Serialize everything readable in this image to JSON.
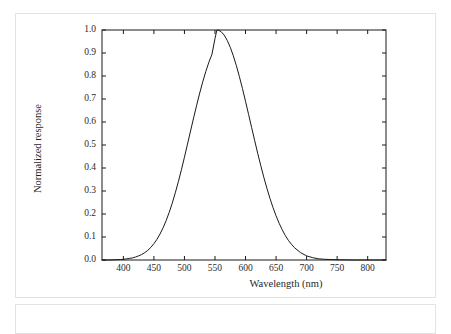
{
  "figure": {
    "chart_data": {
      "type": "line",
      "title": "",
      "subtitle": "",
      "xlabel": "Wavelength (nm)",
      "ylabel": "Normalized response",
      "xlim": [
        365,
        830
      ],
      "ylim": [
        0.0,
        1.0
      ],
      "grid": false,
      "legend": null,
      "annotations": [],
      "xticks": [
        400,
        450,
        500,
        550,
        600,
        650,
        700,
        750,
        800
      ],
      "xtick_labels": [
        "400",
        "450",
        "500",
        "550",
        "600",
        "650",
        "700",
        "750",
        "800"
      ],
      "yticks": [
        0.0,
        0.1,
        0.2,
        0.3,
        0.4,
        0.5,
        0.6,
        0.7,
        0.8,
        0.9,
        1.0
      ],
      "ytick_labels": [
        "0.0",
        "0.1",
        "0.2",
        "0.3",
        "0.4",
        "0.5",
        "0.6",
        "0.7",
        "0.8",
        "0.9",
        "1.0"
      ],
      "line_color": "#1a1a1a",
      "line_width": 1.0,
      "series": [
        {
          "name": "Normalized response",
          "x": [
            365,
            375,
            385,
            395,
            400,
            405,
            410,
            415,
            420,
            425,
            430,
            435,
            440,
            445,
            450,
            455,
            460,
            465,
            470,
            475,
            480,
            485,
            490,
            495,
            500,
            505,
            510,
            515,
            520,
            525,
            530,
            535,
            540,
            545,
            550,
            553,
            555,
            560,
            565,
            570,
            575,
            580,
            585,
            590,
            595,
            600,
            605,
            610,
            615,
            620,
            625,
            630,
            635,
            640,
            645,
            650,
            655,
            660,
            665,
            670,
            675,
            680,
            690,
            700,
            710,
            720,
            730,
            750,
            780,
            810,
            830
          ],
          "y": [
            0.0,
            0.0,
            0.001,
            0.002,
            0.003,
            0.005,
            0.007,
            0.009,
            0.013,
            0.018,
            0.024,
            0.032,
            0.042,
            0.055,
            0.071,
            0.09,
            0.113,
            0.14,
            0.171,
            0.207,
            0.247,
            0.292,
            0.34,
            0.392,
            0.447,
            0.504,
            0.561,
            0.618,
            0.673,
            0.726,
            0.775,
            0.82,
            0.86,
            0.894,
            0.963,
            0.999,
            1.0,
            0.993,
            0.978,
            0.955,
            0.925,
            0.888,
            0.845,
            0.797,
            0.745,
            0.69,
            0.633,
            0.576,
            0.519,
            0.463,
            0.41,
            0.359,
            0.312,
            0.268,
            0.228,
            0.192,
            0.16,
            0.132,
            0.107,
            0.086,
            0.069,
            0.054,
            0.032,
            0.018,
            0.01,
            0.005,
            0.003,
            0.001,
            0.0,
            0.0,
            0.0
          ]
        }
      ],
      "peak": {
        "x": 555,
        "y": 1.0
      },
      "fwhm_nm": 100
    }
  }
}
